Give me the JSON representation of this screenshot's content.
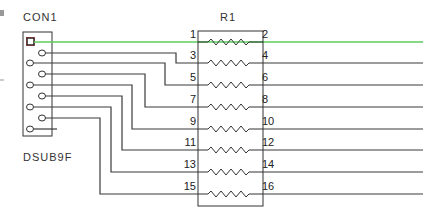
{
  "connector": {
    "ref": "CON1",
    "part": "DSUB9F",
    "pin_count": 9
  },
  "resistor_network": {
    "ref": "R1",
    "left_pins": [
      "1",
      "3",
      "5",
      "7",
      "9",
      "11",
      "13",
      "15"
    ],
    "right_pins": [
      "2",
      "4",
      "6",
      "8",
      "10",
      "12",
      "14",
      "16"
    ],
    "element_count": 8
  },
  "colors": {
    "wire": "#3a3a3a",
    "highlight_wire": "#5ccc5c",
    "component_outline": "#333333",
    "pin1_marker": "#8b1a1a"
  }
}
